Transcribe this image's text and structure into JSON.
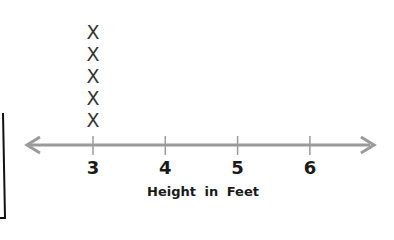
{
  "chart_data": {
    "type": "line_plot",
    "title": "",
    "xlabel": "Height in Feet",
    "ylabel": "",
    "tick_labels": [
      "3",
      "4",
      "5",
      "6"
    ],
    "categories": [
      3,
      4,
      5,
      6
    ],
    "values": [
      5,
      0,
      0,
      0
    ],
    "marker": "X",
    "xlim": [
      2.1,
      6.9
    ],
    "grid": false,
    "legend": null,
    "colors": {
      "axis": "#9a9a9a",
      "marker": "#333333",
      "text": "#1a1a1a",
      "frame": "#111111"
    }
  }
}
